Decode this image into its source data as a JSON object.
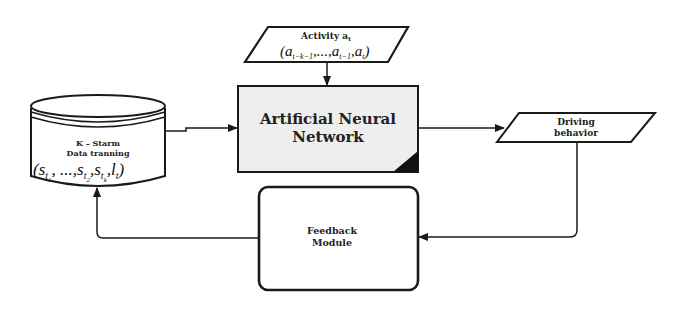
{
  "diagram": {
    "nodes": {
      "data_store": {
        "title_line1": "K – Starm",
        "title_line2": "Data tranning",
        "formula_open": "(",
        "formula_s1": "s",
        "formula_s1_sub": "t",
        "formula_s1_subsub": "1",
        "formula_dots": ", ...,",
        "formula_s2": "s",
        "formula_s2_sub": "t",
        "formula_s2_subsub": "2",
        "formula_comma1": ",",
        "formula_sk": "s",
        "formula_sk_sub": "t",
        "formula_sk_subsub": "k",
        "formula_comma2": ",",
        "formula_l": "l",
        "formula_l_sub": "t",
        "formula_close": ")"
      },
      "activity": {
        "title": "Activity a",
        "title_sub": "t",
        "formula": "(a",
        "f_sub1": "t−k−1",
        "f_mid": ",...,a",
        "f_sub2": "t−1",
        "f_mid2": ",a",
        "f_sub3": "t",
        "f_end": ")"
      },
      "ann": {
        "line1": "Artificial Neural",
        "line2": "Network"
      },
      "driving": {
        "line1": "Driving",
        "line2": "behavior"
      },
      "feedback": {
        "line1": "Feedback",
        "line2": "Module"
      }
    },
    "edges": [
      {
        "from": "data_store",
        "to": "ann"
      },
      {
        "from": "activity",
        "to": "ann"
      },
      {
        "from": "ann",
        "to": "driving"
      },
      {
        "from": "driving",
        "to": "feedback"
      },
      {
        "from": "feedback",
        "to": "data_store"
      }
    ],
    "colors": {
      "stroke": "#1a1a1a",
      "ann_fill": "#eeeeee",
      "corner_fill": "#111111",
      "background": "#ffffff"
    }
  }
}
